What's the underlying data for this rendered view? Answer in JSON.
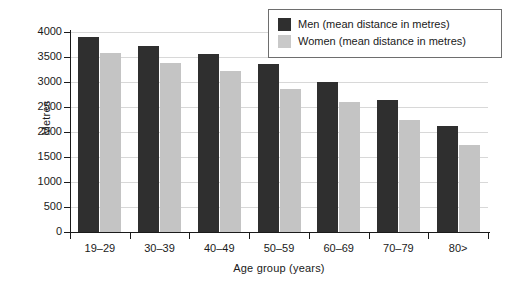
{
  "chart_data": {
    "type": "bar",
    "title": "",
    "xlabel": "Age group (years)",
    "ylabel": "Metres",
    "categories": [
      "19–29",
      "30–39",
      "40–49",
      "50–59",
      "60–69",
      "70–79",
      "80>"
    ],
    "series": [
      {
        "name": "Men (mean distance in metres)",
        "color": "#2f2f2f",
        "values": [
          3900,
          3720,
          3570,
          3360,
          3000,
          2650,
          2120
        ]
      },
      {
        "name": "Women (mean distance in metres)",
        "color": "#c4c4c4",
        "values": [
          3580,
          3380,
          3220,
          2870,
          2600,
          2250,
          1740
        ]
      }
    ],
    "ylim": [
      0,
      4000
    ],
    "yticks": [
      0,
      500,
      1000,
      1500,
      2000,
      2500,
      3000,
      3500,
      4000
    ],
    "ytick_labels": [
      "0",
      "500",
      "1000",
      "1500",
      "2000",
      "2500",
      "3000",
      "3500",
      "4000"
    ],
    "grid": true,
    "legend_position": "top-right"
  },
  "legend": {
    "items": [
      {
        "label": "Men (mean distance in metres)",
        "swatch": "men"
      },
      {
        "label": "Women (mean distance in metres)",
        "swatch": "women"
      }
    ]
  },
  "colors": {
    "men": "#2f2f2f",
    "women": "#c4c4c4",
    "grid": "#d8d8d8",
    "axis": "#1a1a1a",
    "background": "#ffffff"
  }
}
